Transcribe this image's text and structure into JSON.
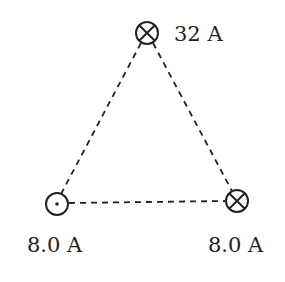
{
  "diagram": {
    "wires": [
      {
        "id": "top",
        "current": "32 A",
        "direction": "into-page",
        "symbol": "circle-cross"
      },
      {
        "id": "bottom-left",
        "current": "8.0 A",
        "direction": "out-of-page",
        "symbol": "circle-dot"
      },
      {
        "id": "bottom-right",
        "current": "8.0 A",
        "direction": "into-page",
        "symbol": "circle-cross"
      }
    ],
    "edges": "dashed"
  },
  "labels": {
    "top": "32 A",
    "bottom_left": "8.0 A",
    "bottom_right": "8.0 A"
  }
}
